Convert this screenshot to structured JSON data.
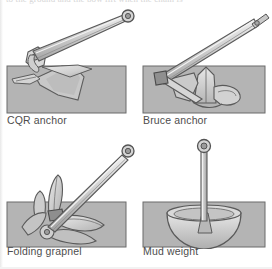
{
  "page": {
    "cut_off_header_text": "to the ground and the bow lift when the chain is",
    "background_color": "#ffffff"
  },
  "style": {
    "seabed_fill": "#b4b4b4",
    "seabed_stroke": "#6e6e6e",
    "metal_light": "#e2e2e2",
    "metal_mid": "#c6c6c6",
    "metal_dark": "#9a9a9a",
    "outline": "#5a5a5a",
    "caption_color": "#4d4d4d"
  },
  "figure": {
    "panels": [
      {
        "id": "cqr-anchor",
        "caption": "CQR anchor",
        "description": "Plough (CQR) anchor with hinged shank buried point-down in the seabed"
      },
      {
        "id": "bruce-anchor",
        "caption": "Bruce anchor",
        "description": "Bruce claw anchor with three-fluke scoop set into the seabed"
      },
      {
        "id": "folding-grapnel",
        "caption": "Folding grapnel",
        "description": "Four-armed folding grapnel anchor with flukes hooked into the seabed"
      },
      {
        "id": "mud-weight",
        "caption": "Mud weight",
        "description": "Dish-shaped mud weight on a straight rod resting on the seabed"
      }
    ]
  }
}
